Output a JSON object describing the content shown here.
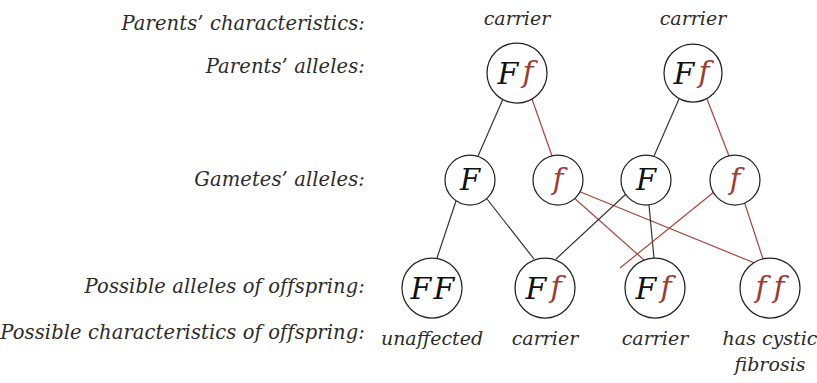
{
  "diagram": {
    "colors": {
      "dominant_allele": "#111111",
      "recessive_allele": "#9e3b32",
      "line_black": "#333333",
      "line_red": "#a8443a",
      "circle_stroke": "#222222",
      "background": "#ffffff",
      "text": "#2b2b2b"
    },
    "row_labels": {
      "parents_characteristics": "Parents’ characteristics:",
      "parents_alleles": "Parents’ alleles:",
      "gametes_alleles": "Gametes’ alleles:",
      "possible_alleles": "Possible alleles of offspring:",
      "possible_characteristics": "Possible characteristics of offspring:"
    },
    "parents": [
      {
        "id": "parent-1",
        "characteristic": "carrier",
        "allele_dominant": "F",
        "allele_recessive": "f"
      },
      {
        "id": "parent-2",
        "characteristic": "carrier",
        "allele_dominant": "F",
        "allele_recessive": "f"
      }
    ],
    "gametes": [
      {
        "id": "gamete-1",
        "allele": "F",
        "type": "dominant"
      },
      {
        "id": "gamete-2",
        "allele": "f",
        "type": "recessive"
      },
      {
        "id": "gamete-3",
        "allele": "F",
        "type": "dominant"
      },
      {
        "id": "gamete-4",
        "allele": "f",
        "type": "recessive"
      }
    ],
    "offspring": [
      {
        "id": "offspring-1",
        "genotype": "FF",
        "first": "F",
        "first_type": "dominant",
        "second": "F",
        "second_type": "dominant",
        "characteristic": "unaffected",
        "characteristic_line2": ""
      },
      {
        "id": "offspring-2",
        "genotype": "Ff",
        "first": "F",
        "first_type": "dominant",
        "second": "f",
        "second_type": "recessive",
        "characteristic": "carrier",
        "characteristic_line2": ""
      },
      {
        "id": "offspring-3",
        "genotype": "Ff",
        "first": "F",
        "first_type": "dominant",
        "second": "f",
        "second_type": "recessive",
        "characteristic": "carrier",
        "characteristic_line2": ""
      },
      {
        "id": "offspring-4",
        "genotype": "ff",
        "first": "f",
        "first_type": "recessive",
        "second": "f",
        "second_type": "recessive",
        "characteristic": "has cystic",
        "characteristic_line2": "fibrosis"
      }
    ]
  }
}
